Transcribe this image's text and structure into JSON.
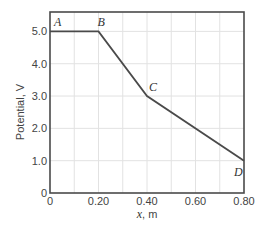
{
  "chart_data": {
    "type": "line",
    "title": "",
    "xlabel": "x, m",
    "xlabel_var": "x",
    "xlabel_unit": ", m",
    "ylabel": "Potential, V",
    "xlim": [
      0,
      0.8
    ],
    "ylim": [
      0,
      5.6
    ],
    "grid": true,
    "legend": null,
    "x_ticks": [
      0,
      0.2,
      0.4,
      0.6,
      0.8
    ],
    "x_tick_labels": [
      "0",
      "0.20",
      "0.40",
      "0.60",
      "0.80"
    ],
    "y_ticks": [
      0,
      1,
      2,
      3,
      4,
      5
    ],
    "y_tick_labels": [
      "0",
      "1.0",
      "2.0",
      "3.0",
      "4.0",
      "5.0"
    ],
    "series": [
      {
        "name": "Potential",
        "x": [
          0,
          0.2,
          0.4,
          0.8
        ],
        "y": [
          5.0,
          5.0,
          3.0,
          1.0
        ],
        "color": "#4a4a4a"
      }
    ],
    "annotations": [
      {
        "label": "A",
        "x": 0.0,
        "y": 5.0
      },
      {
        "label": "B",
        "x": 0.2,
        "y": 5.0
      },
      {
        "label": "C",
        "x": 0.4,
        "y": 3.0
      },
      {
        "label": "D",
        "x": 0.8,
        "y": 1.0
      }
    ]
  },
  "colors": {
    "line": "#4a4a4a",
    "axis": "#4a4a4a",
    "grid": "#e2e2e2",
    "text": "#444444"
  }
}
